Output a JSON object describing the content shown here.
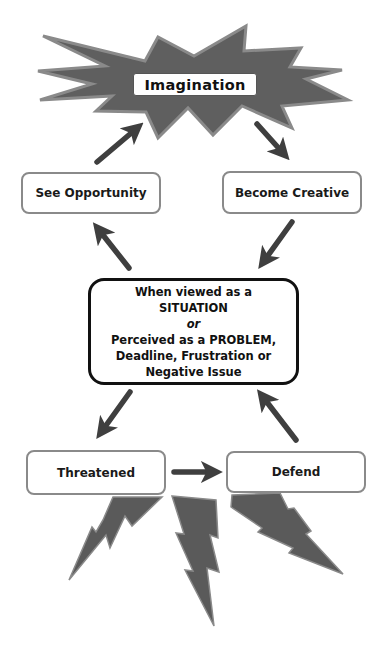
{
  "diagram": {
    "type": "cycle-flowchart",
    "colors": {
      "shape_fill": "#5f5f5f",
      "shape_stroke": "#8a8a8a",
      "arrow": "#3f3f3f",
      "box_border": "#8a8a8a",
      "center_border": "#111111",
      "text": "#111111"
    },
    "top_node": {
      "label": "Imagination",
      "shape": "starburst"
    },
    "left_upper_node": {
      "label": "See Opportunity"
    },
    "right_upper_node": {
      "label": "Become Creative"
    },
    "center_node": {
      "line1": "When viewed as a",
      "line2": "SITUATION",
      "line3": "or",
      "line4": "Perceived as a PROBLEM,",
      "line5": "Deadline, Frustration or",
      "line6": "Negative Issue"
    },
    "left_lower_node": {
      "label": "Threatened"
    },
    "right_lower_node": {
      "label": "Defend"
    },
    "edges": [
      {
        "from": "Imagination",
        "to": "Become Creative"
      },
      {
        "from": "Become Creative",
        "to": "Center"
      },
      {
        "from": "Center",
        "to": "See Opportunity"
      },
      {
        "from": "See Opportunity",
        "to": "Imagination"
      },
      {
        "from": "Center",
        "to": "Threatened"
      },
      {
        "from": "Threatened",
        "to": "Defend"
      },
      {
        "from": "Defend",
        "to": "Center"
      }
    ],
    "decorations": {
      "bottom": "lightning-bolts",
      "bolt_count": 3
    }
  }
}
